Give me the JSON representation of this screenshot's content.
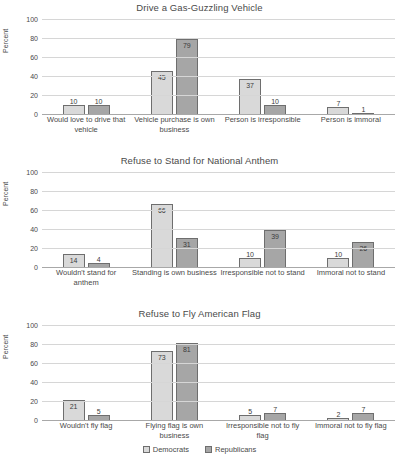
{
  "legend": {
    "position": "bottom-center",
    "items": [
      {
        "label": "Democrats",
        "color": "#d9d9d9"
      },
      {
        "label": "Republicans",
        "color": "#a6a6a6"
      }
    ]
  },
  "chart_data": [
    {
      "type": "bar",
      "title": "Drive a Gas-Guzzling Vehicle",
      "xlabel": "",
      "ylabel": "Percent",
      "ylim": [
        0,
        100
      ],
      "yticks": [
        0,
        20,
        40,
        60,
        80,
        100
      ],
      "grid": true,
      "categories": [
        "Would love to drive that vehicle",
        "Vehicle purchase is own business",
        "Person is irresponsible",
        "Person is immoral"
      ],
      "series": [
        {
          "name": "Democrats",
          "values": [
            10,
            45,
            37,
            7
          ]
        },
        {
          "name": "Republicans",
          "values": [
            10,
            79,
            10,
            1
          ]
        }
      ]
    },
    {
      "type": "bar",
      "title": "Refuse to Stand for National Anthem",
      "xlabel": "",
      "ylabel": "Percent",
      "ylim": [
        0,
        100
      ],
      "yticks": [
        0,
        20,
        40,
        60,
        80,
        100
      ],
      "grid": true,
      "categories": [
        "Wouldn't stand for anthem",
        "Standing is own business",
        "Irresponsible not to stand",
        "Immoral not to stand"
      ],
      "series": [
        {
          "name": "Democrats",
          "values": [
            14,
            66,
            10,
            10
          ]
        },
        {
          "name": "Republicans",
          "values": [
            4,
            31,
            39,
            26
          ]
        }
      ]
    },
    {
      "type": "bar",
      "title": "Refuse to Fly American Flag",
      "xlabel": "",
      "ylabel": "Percent",
      "ylim": [
        0,
        100
      ],
      "yticks": [
        0,
        20,
        40,
        60,
        80,
        100
      ],
      "grid": true,
      "categories": [
        "Wouldn't fly flag",
        "Flying flag is own business",
        "Irresponsible not to fly flag",
        "Immoral not to fly flag"
      ],
      "series": [
        {
          "name": "Democrats",
          "values": [
            21,
            73,
            5,
            2
          ]
        },
        {
          "name": "Republicans",
          "values": [
            5,
            81,
            7,
            7
          ]
        }
      ]
    }
  ]
}
